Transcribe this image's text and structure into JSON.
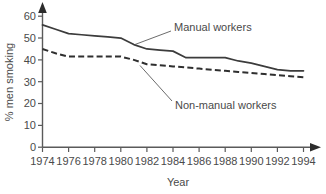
{
  "chart_data": {
    "type": "line",
    "title": "",
    "xlabel": "Year",
    "ylabel": "% men smoking",
    "xlim": [
      1974,
      1994
    ],
    "ylim": [
      0,
      60
    ],
    "grid": false,
    "legend_position": "inline-annotations",
    "x": [
      1974,
      1975,
      1976,
      1977,
      1978,
      1979,
      1980,
      1981,
      1982,
      1983,
      1984,
      1985,
      1986,
      1987,
      1988,
      1989,
      1990,
      1991,
      1992,
      1993,
      1994
    ],
    "xticks": [
      1974,
      1976,
      1978,
      1980,
      1982,
      1984,
      1986,
      1988,
      1990,
      1992,
      1994
    ],
    "xtick_labels": [
      "1974",
      "1976",
      "1978",
      "1980",
      "1982",
      "1984",
      "1986",
      "1988",
      "1990",
      "1992",
      "1994"
    ],
    "yticks": [
      0,
      10,
      20,
      30,
      40,
      50,
      60
    ],
    "ytick_labels": [
      "0",
      "10",
      "20",
      "30",
      "40",
      "50",
      "60"
    ],
    "series": [
      {
        "name": "Manual workers",
        "style": "solid",
        "color": "#3c3c3c",
        "annotation": "Manual workers",
        "values": [
          56,
          54,
          52,
          51.5,
          51,
          50.5,
          50,
          47,
          45,
          44.5,
          44,
          41,
          41,
          41,
          41,
          39.5,
          38.5,
          37,
          35.5,
          35,
          35
        ]
      },
      {
        "name": "Non-manual workers",
        "style": "dashed",
        "color": "#2f2f2f",
        "annotation": "Non-manual workers",
        "values": [
          45,
          43,
          41.5,
          41.5,
          41.5,
          41.5,
          41.5,
          40,
          38,
          37.5,
          37,
          36.5,
          36,
          35.5,
          35,
          34.5,
          34,
          33.5,
          33,
          32.5,
          32
        ]
      }
    ]
  },
  "annotations": {
    "manual_label": "Manual workers",
    "nonmanual_label": "Non-manual workers"
  },
  "axes": {
    "x_title": "Year",
    "y_title": "% men smoking"
  }
}
